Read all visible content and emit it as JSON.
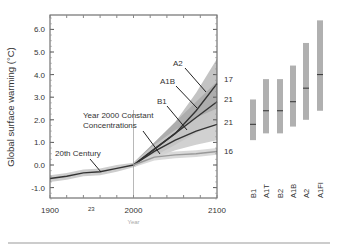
{
  "chart_data": {
    "type": "line",
    "title": "",
    "xlabel": "Year",
    "ylabel": "Global surface warming (°C)",
    "xlim": [
      1900,
      2100
    ],
    "ylim": [
      -1.5,
      6.5
    ],
    "x_ticks": [
      "1900",
      "2000",
      "2100"
    ],
    "y_ticks": [
      "-1.0",
      "0.0",
      "1.0",
      "2.0",
      "3.0",
      "4.0",
      "5.0",
      "6.0"
    ],
    "grid": false,
    "annotations": [
      "20th Century",
      "Year 2000 Constant",
      "Concentrations",
      "B1",
      "A1B",
      "A2",
      "23"
    ],
    "series": [
      {
        "name": "20th Century",
        "models": "23",
        "x": [
          1900,
          1920,
          1940,
          1960,
          1980,
          2000
        ],
        "y": [
          -0.6,
          -0.5,
          -0.35,
          -0.3,
          -0.15,
          0.0
        ],
        "band": [
          0.15,
          0.15,
          0.15,
          0.15,
          0.15,
          0.1
        ]
      },
      {
        "name": "A2",
        "models": "17",
        "x": [
          2000,
          2025,
          2050,
          2075,
          2100
        ],
        "y": [
          0.0,
          0.7,
          1.4,
          2.4,
          3.6
        ],
        "band": [
          0.1,
          0.3,
          0.5,
          0.8,
          1.1
        ]
      },
      {
        "name": "A1B",
        "models": "21",
        "x": [
          2000,
          2025,
          2050,
          2075,
          2100
        ],
        "y": [
          0.0,
          0.7,
          1.4,
          2.1,
          2.8
        ],
        "band": [
          0.1,
          0.3,
          0.5,
          0.7,
          0.9
        ]
      },
      {
        "name": "B1",
        "models": "21",
        "x": [
          2000,
          2025,
          2050,
          2075,
          2100
        ],
        "y": [
          0.0,
          0.6,
          1.1,
          1.5,
          1.8
        ],
        "band": [
          0.1,
          0.3,
          0.45,
          0.6,
          0.7
        ]
      },
      {
        "name": "Year 2000 Constant Concentrations",
        "models": "16",
        "x": [
          2000,
          2025,
          2050,
          2075,
          2100
        ],
        "y": [
          0.0,
          0.35,
          0.45,
          0.5,
          0.6
        ],
        "band": [
          0.1,
          0.15,
          0.15,
          0.15,
          0.15
        ]
      }
    ],
    "scenario_ranges": {
      "categories": [
        "B1",
        "A1T",
        "B2",
        "A1B",
        "A2",
        "A1FI"
      ],
      "low": [
        1.1,
        1.4,
        1.4,
        1.7,
        2.0,
        2.4
      ],
      "best": [
        1.8,
        2.4,
        2.4,
        2.8,
        3.4,
        4.0
      ],
      "high": [
        2.9,
        3.8,
        3.8,
        4.4,
        5.4,
        6.4
      ]
    }
  },
  "colors": {
    "axis": "#555555",
    "band": "#bdbdbd",
    "line": "#333333",
    "bar": "#b0b0b0",
    "text": "#333333"
  }
}
